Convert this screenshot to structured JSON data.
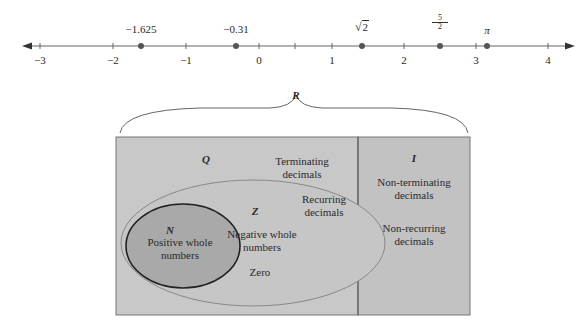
{
  "number_line": {
    "ticks": [
      {
        "label": "−3",
        "x": 40
      },
      {
        "label": "−2",
        "x": 113
      },
      {
        "label": "−1",
        "x": 186
      },
      {
        "label": "0",
        "x": 259
      },
      {
        "label": "1",
        "x": 332
      },
      {
        "label": "2",
        "x": 404
      },
      {
        "label": "3",
        "x": 476
      },
      {
        "label": "4",
        "x": 548
      }
    ],
    "points": [
      {
        "label": "−1.625",
        "value": -1.625
      },
      {
        "label": "−0.31",
        "value": -0.31
      },
      {
        "label": "√2",
        "value": 1.414
      },
      {
        "label": "5/2",
        "value": 2.5
      },
      {
        "label": "π",
        "value": 3.1416
      }
    ],
    "labels": {
      "p0": "−1.625",
      "p1": "−0.31",
      "p2_radicand": "2",
      "p3_num": "5",
      "p3_den": "2",
      "p4": "π"
    }
  },
  "sets": {
    "R": {
      "symbol": "R"
    },
    "Q": {
      "symbol": "Q",
      "items": [
        "Terminating decimals",
        "Recurring decimals"
      ],
      "t1a": "Terminating",
      "t1b": "decimals",
      "t2a": "Recurring",
      "t2b": "decimals"
    },
    "I": {
      "symbol": "I",
      "t1a": "Non-terminating",
      "t1b": "decimals",
      "t2a": "Non-recurring",
      "t2b": "decimals"
    },
    "Z": {
      "symbol": "Z",
      "t1a": "Negative whole",
      "t1b": "numbers",
      "t2": "Zero"
    },
    "N": {
      "symbol": "N",
      "t1a": "Positive whole",
      "t1b": "numbers"
    }
  },
  "colors": {
    "Q_fill": "#c8c8c8",
    "I_fill": "#c2c2c2",
    "N_fill": "#a9a9a9",
    "line": "#555555"
  }
}
